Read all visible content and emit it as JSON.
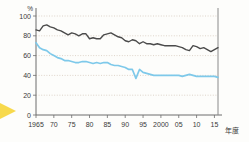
{
  "chart_data": {
    "type": "line",
    "title": "",
    "subtitle": "",
    "xlabel": "年度",
    "ylabel": "%",
    "unit_label": "%",
    "xlim": [
      1965,
      2016
    ],
    "ylim": [
      0,
      100
    ],
    "grid": true,
    "legend_position": "none",
    "y_ticks": [
      0,
      20,
      40,
      60,
      80,
      100
    ],
    "y_tick_labels": [
      "0",
      "20",
      "40",
      "60",
      "80",
      "100"
    ],
    "x_ticks": [
      1965,
      1970,
      1975,
      1980,
      1985,
      1990,
      1995,
      2000,
      2005,
      2010,
      2015
    ],
    "x_tick_labels": [
      "1965",
      "70",
      "75",
      "80",
      "85",
      "90",
      "95",
      "2000",
      "05",
      "10",
      "15"
    ],
    "x": [
      1965,
      1966,
      1967,
      1968,
      1969,
      1970,
      1971,
      1972,
      1973,
      1974,
      1975,
      1976,
      1977,
      1978,
      1979,
      1980,
      1981,
      1982,
      1983,
      1984,
      1985,
      1986,
      1987,
      1988,
      1989,
      1990,
      1991,
      1992,
      1993,
      1994,
      1995,
      1996,
      1997,
      1998,
      1999,
      2000,
      2001,
      2002,
      2003,
      2004,
      2005,
      2006,
      2007,
      2008,
      2009,
      2010,
      2011,
      2012,
      2013,
      2014,
      2015,
      2016
    ],
    "series": [
      {
        "name": "生産額ベース",
        "color": "#4b4b4b",
        "values": [
          86,
          85,
          90,
          91,
          89,
          88,
          86,
          85,
          83,
          81,
          83,
          82,
          80,
          82,
          82,
          77,
          78,
          77,
          77,
          81,
          82,
          83,
          81,
          79,
          78,
          75,
          74,
          76,
          75,
          72,
          74,
          72,
          72,
          71,
          72,
          71,
          70,
          70,
          70,
          70,
          69,
          68,
          66,
          65,
          70,
          69,
          67,
          68,
          66,
          64,
          66,
          68
        ]
      },
      {
        "name": "カロリーベース",
        "color": "#7ec9ea",
        "values": [
          73,
          68,
          66,
          65,
          62,
          60,
          58,
          57,
          55,
          55,
          54,
          53,
          53,
          54,
          54,
          53,
          52,
          53,
          52,
          53,
          53,
          51,
          50,
          50,
          49,
          48,
          46,
          46,
          37,
          46,
          43,
          42,
          41,
          40,
          40,
          40,
          40,
          40,
          40,
          40,
          40,
          39,
          40,
          41,
          40,
          39,
          39,
          39,
          39,
          39,
          39,
          38
        ]
      }
    ],
    "annotations": [
      {
        "name": "pointer-arrow",
        "color": "#f7d94c",
        "position": "left-edge"
      }
    ]
  },
  "axis": {
    "y_unit": "%",
    "x_unit": "年度"
  }
}
